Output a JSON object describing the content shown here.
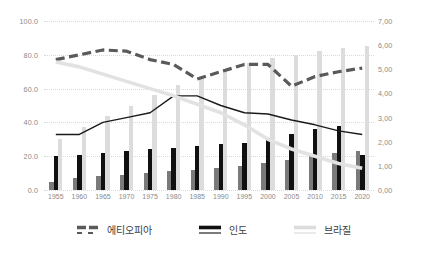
{
  "chart_data": {
    "type": "bar",
    "title": "",
    "subtitle": "",
    "xlabel": "",
    "ylabel": "",
    "y2label": "",
    "grid": true,
    "legend_position": "bottom",
    "categories": [
      "1955",
      "1960",
      "1965",
      "1970",
      "1975",
      "1980",
      "1985",
      "1990",
      "1995",
      "2000",
      "2005",
      "2010",
      "2015",
      "2020"
    ],
    "ylim": [
      0,
      100
    ],
    "y2lim": [
      0,
      7
    ],
    "yticks": [
      "0.0",
      "20.0",
      "40.0",
      "60.0",
      "80.0",
      "100.0"
    ],
    "ytick_values": [
      0,
      20,
      40,
      60,
      80,
      100
    ],
    "y2ticks": [
      "0,00",
      "1,00",
      "2,00",
      "3,00",
      "4,00",
      "5,00",
      "6,00",
      "7,00"
    ],
    "y2tick_values": [
      0,
      1,
      2,
      3,
      4,
      5,
      6,
      7
    ],
    "bar_series": [
      {
        "name": "에티오피아",
        "axis": "left",
        "color": "#7a7a7a",
        "values": [
          5,
          7,
          8,
          9,
          10,
          11,
          12,
          13,
          14,
          16,
          18,
          20,
          22,
          23
        ]
      },
      {
        "name": "인도",
        "axis": "left",
        "color": "#101010",
        "values": [
          20,
          21,
          22,
          23,
          24,
          25,
          26,
          27,
          28,
          31,
          33,
          36,
          38,
          21
        ]
      },
      {
        "name": "브라질",
        "axis": "left",
        "color": "#dcdcdc",
        "values": [
          30,
          37,
          44,
          50,
          56,
          62,
          67,
          71,
          75,
          78,
          80,
          82,
          84,
          85
        ]
      }
    ],
    "line_series": [
      {
        "name": "에티오피아",
        "axis": "right",
        "style": "dashed",
        "color": "#5a5a5a",
        "values": [
          5.4,
          5.6,
          5.8,
          5.75,
          5.4,
          5.2,
          4.6,
          4.9,
          5.2,
          5.2,
          4.3,
          4.7,
          4.9,
          5.05
        ]
      },
      {
        "name": "인도",
        "axis": "right",
        "style": "solid",
        "color": "#1a1a1a",
        "values": [
          2.3,
          2.3,
          2.8,
          3.0,
          3.2,
          3.9,
          3.9,
          3.5,
          3.2,
          3.15,
          2.9,
          2.7,
          2.45,
          2.3
        ]
      },
      {
        "name": "브라질",
        "axis": "right",
        "style": "solid-thick",
        "color": "#e2e2e2",
        "values": [
          5.3,
          5.1,
          4.8,
          4.5,
          4.2,
          3.9,
          3.55,
          3.2,
          2.7,
          2.1,
          1.7,
          1.4,
          1.1,
          0.9
        ]
      }
    ]
  },
  "legend": {
    "items": [
      {
        "label": "에티오피아",
        "marker": "dashed-line-swatch"
      },
      {
        "label": "인도",
        "marker": "solid-line-swatch"
      },
      {
        "label": "브라질",
        "marker": "thick-gray-line-swatch"
      }
    ]
  }
}
